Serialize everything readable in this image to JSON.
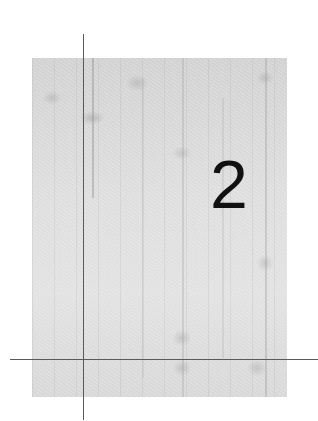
{
  "chapter": {
    "number": "2"
  },
  "colors": {
    "plate": "#dcdcdc",
    "crop_lines": "#5a5a5a",
    "number": "#111111",
    "background": "#ffffff"
  }
}
